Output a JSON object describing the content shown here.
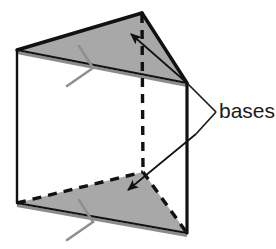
{
  "figure": {
    "labels": [
      {
        "id": "bases",
        "text": "bases",
        "x": 217,
        "y": 112
      }
    ],
    "colors": {
      "face_fill": "#a8a8a8",
      "outline": "#111111",
      "hidden_edge": "#111111",
      "tick_mark": "#8f8f8f",
      "leader_line": "#1a1a1a",
      "background": "#ffffff",
      "text": "#1a1a1a"
    },
    "geometry": {
      "top_face": {
        "name": "top-base-triangle",
        "points": "17,50 142,13 187,83",
        "visible": true
      },
      "bottom_face": {
        "name": "bottom-base-triangle",
        "points": "17,203 143,172 187,233",
        "visible": true
      },
      "front_quad": {
        "name": "front-rectangular-face",
        "points": "17,50 187,83 187,233 17,203"
      },
      "vertical_edges": [
        {
          "name": "left-vertical-edge",
          "x1": 17,
          "y1": 50,
          "x2": 17,
          "y2": 203,
          "style": "solid"
        },
        {
          "name": "right-vertical-edge",
          "x1": 187,
          "y1": 83,
          "x2": 187,
          "y2": 233,
          "style": "solid"
        },
        {
          "name": "back-vertical-edge",
          "x1": 142,
          "y1": 14,
          "x2": 143,
          "y2": 172,
          "style": "dashed"
        }
      ],
      "solid_edges": [
        {
          "name": "top-back-left-edge",
          "x1": 17,
          "y1": 50,
          "x2": 142,
          "y2": 13
        },
        {
          "name": "top-back-right-edge",
          "x1": 142,
          "y1": 13,
          "x2": 187,
          "y2": 83
        },
        {
          "name": "top-front-edge",
          "x1": 17,
          "y1": 50,
          "x2": 187,
          "y2": 83
        },
        {
          "name": "bottom-front-edge",
          "x1": 17,
          "y1": 203,
          "x2": 187,
          "y2": 233
        }
      ],
      "dashed_edges": [
        {
          "name": "bottom-back-left-edge",
          "x1": 17,
          "y1": 203,
          "x2": 143,
          "y2": 172
        },
        {
          "name": "bottom-back-right-edge",
          "x1": 143,
          "y1": 172,
          "x2": 187,
          "y2": 233
        }
      ],
      "tick_marks": [
        {
          "name": "top-edge-tick",
          "cx": 93,
          "cy": 68
        },
        {
          "name": "bottom-edge-tick",
          "cx": 93,
          "cy": 222
        }
      ],
      "arrows": [
        {
          "name": "upper-base-arrow",
          "x1": 187,
          "y1": 83,
          "x2": 131,
          "y2": 34
        },
        {
          "name": "lower-base-arrow",
          "x1": 196,
          "y1": 134,
          "x2": 128,
          "y2": 190
        }
      ],
      "leader_lines": [
        {
          "name": "upper-leader-line",
          "x1": 216,
          "y1": 112,
          "x2": 187,
          "y2": 83
        },
        {
          "name": "lower-leader-line",
          "x1": 216,
          "y1": 112,
          "x2": 196,
          "y2": 134
        }
      ]
    }
  }
}
